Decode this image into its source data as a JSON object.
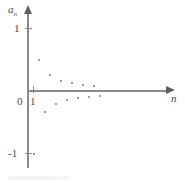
{
  "chart_data": {
    "type": "scatter",
    "title": "",
    "subtitle": "",
    "xlabel": "n",
    "ylabel": "a_n",
    "ylabel_display": "a",
    "ylabel_sub": "n",
    "grid": false,
    "legend": null,
    "xlim": [
      0,
      14
    ],
    "ylim": [
      -1.35,
      1.35
    ],
    "y_ticks": [
      {
        "value": 1,
        "label": "1"
      },
      {
        "value": -1,
        "label": "-1"
      }
    ],
    "x_ticks": [
      {
        "value": 1,
        "label": "1"
      }
    ],
    "origin_label": "0",
    "series": [
      {
        "name": "a_n = (-1)^n / n",
        "x": [
          1,
          2,
          3,
          4,
          5,
          6,
          7,
          8,
          9,
          10,
          11,
          12,
          13
        ],
        "y": [
          -1,
          0.5,
          -0.333,
          0.25,
          -0.2,
          0.167,
          -0.143,
          0.125,
          -0.111,
          0.1,
          -0.091,
          0.083,
          -0.077
        ]
      }
    ],
    "annotations": []
  },
  "figure": {
    "y_axis_name": "vertical-axis",
    "x_axis_name": "horizontal-axis"
  }
}
